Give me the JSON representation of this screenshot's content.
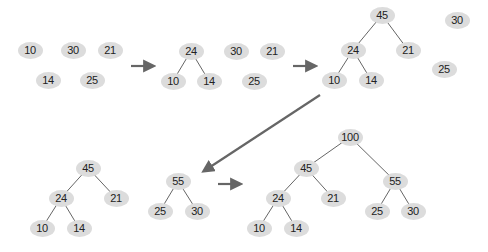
{
  "diagram": {
    "title": "",
    "colors": {
      "node_fill": "#dcdcdc",
      "node_text": "#222222",
      "edge": "#666666",
      "arrow": "#666666",
      "background": "#ffffff"
    },
    "stages": [
      {
        "id": "stage-1",
        "nodes": [
          {
            "id": "s1-10",
            "label": "10",
            "x": 30,
            "y": 50
          },
          {
            "id": "s1-30",
            "label": "30",
            "x": 73,
            "y": 50
          },
          {
            "id": "s1-21",
            "label": "21",
            "x": 110,
            "y": 50
          },
          {
            "id": "s1-14",
            "label": "14",
            "x": 48,
            "y": 80
          },
          {
            "id": "s1-25",
            "label": "25",
            "x": 92,
            "y": 80
          }
        ],
        "edges": []
      },
      {
        "id": "stage-2",
        "nodes": [
          {
            "id": "s2-24",
            "label": "24",
            "x": 191,
            "y": 51
          },
          {
            "id": "s2-10",
            "label": "10",
            "x": 173,
            "y": 81
          },
          {
            "id": "s2-14",
            "label": "14",
            "x": 209,
            "y": 81
          },
          {
            "id": "s2-30",
            "label": "30",
            "x": 236,
            "y": 51
          },
          {
            "id": "s2-21",
            "label": "21",
            "x": 272,
            "y": 51
          },
          {
            "id": "s2-25",
            "label": "25",
            "x": 254,
            "y": 81
          }
        ],
        "edges": [
          [
            "s2-24",
            "s2-10"
          ],
          [
            "s2-24",
            "s2-14"
          ]
        ]
      },
      {
        "id": "stage-3",
        "nodes": [
          {
            "id": "s3-45",
            "label": "45",
            "x": 382,
            "y": 15
          },
          {
            "id": "s3-24",
            "label": "24",
            "x": 353,
            "y": 50
          },
          {
            "id": "s3-21",
            "label": "21",
            "x": 408,
            "y": 50
          },
          {
            "id": "s3-10",
            "label": "10",
            "x": 334,
            "y": 80
          },
          {
            "id": "s3-14",
            "label": "14",
            "x": 371,
            "y": 80
          },
          {
            "id": "s3-30",
            "label": "30",
            "x": 457,
            "y": 20
          },
          {
            "id": "s3-25",
            "label": "25",
            "x": 444,
            "y": 69
          }
        ],
        "edges": [
          [
            "s3-45",
            "s3-24"
          ],
          [
            "s3-45",
            "s3-21"
          ],
          [
            "s3-24",
            "s3-10"
          ],
          [
            "s3-24",
            "s3-14"
          ]
        ]
      },
      {
        "id": "stage-4",
        "nodes": [
          {
            "id": "s4-45",
            "label": "45",
            "x": 88,
            "y": 168
          },
          {
            "id": "s4-24",
            "label": "24",
            "x": 61,
            "y": 198
          },
          {
            "id": "s4-21",
            "label": "21",
            "x": 116,
            "y": 198
          },
          {
            "id": "s4-10",
            "label": "10",
            "x": 42,
            "y": 228
          },
          {
            "id": "s4-14",
            "label": "14",
            "x": 79,
            "y": 228
          },
          {
            "id": "s4-55",
            "label": "55",
            "x": 178,
            "y": 181
          },
          {
            "id": "s4-25",
            "label": "25",
            "x": 160,
            "y": 211
          },
          {
            "id": "s4-30",
            "label": "30",
            "x": 197,
            "y": 211
          }
        ],
        "edges": [
          [
            "s4-45",
            "s4-24"
          ],
          [
            "s4-45",
            "s4-21"
          ],
          [
            "s4-24",
            "s4-10"
          ],
          [
            "s4-24",
            "s4-14"
          ],
          [
            "s4-55",
            "s4-25"
          ],
          [
            "s4-55",
            "s4-30"
          ]
        ]
      },
      {
        "id": "stage-5",
        "nodes": [
          {
            "id": "s5-100",
            "label": "100",
            "x": 350,
            "y": 137
          },
          {
            "id": "s5-45",
            "label": "45",
            "x": 306,
            "y": 168
          },
          {
            "id": "s5-55",
            "label": "55",
            "x": 395,
            "y": 181
          },
          {
            "id": "s5-24",
            "label": "24",
            "x": 278,
            "y": 198
          },
          {
            "id": "s5-21",
            "label": "21",
            "x": 333,
            "y": 198
          },
          {
            "id": "s5-25",
            "label": "25",
            "x": 377,
            "y": 211
          },
          {
            "id": "s5-30",
            "label": "30",
            "x": 413,
            "y": 211
          },
          {
            "id": "s5-10",
            "label": "10",
            "x": 259,
            "y": 228
          },
          {
            "id": "s5-14",
            "label": "14",
            "x": 296,
            "y": 228
          }
        ],
        "edges": [
          [
            "s5-100",
            "s5-45"
          ],
          [
            "s5-100",
            "s5-55"
          ],
          [
            "s5-45",
            "s5-24"
          ],
          [
            "s5-45",
            "s5-21"
          ],
          [
            "s5-24",
            "s5-10"
          ],
          [
            "s5-24",
            "s5-14"
          ],
          [
            "s5-55",
            "s5-25"
          ],
          [
            "s5-55",
            "s5-30"
          ]
        ]
      }
    ],
    "arrows": [
      {
        "id": "arrow-1-2",
        "x1": 131,
        "y1": 66,
        "x2": 153,
        "y2": 66
      },
      {
        "id": "arrow-2-3",
        "x1": 293,
        "y1": 66,
        "x2": 315,
        "y2": 66
      },
      {
        "id": "arrow-3-4",
        "x1": 320,
        "y1": 95,
        "x2": 204,
        "y2": 171
      },
      {
        "id": "arrow-4-5",
        "x1": 218,
        "y1": 184,
        "x2": 240,
        "y2": 184
      }
    ]
  }
}
